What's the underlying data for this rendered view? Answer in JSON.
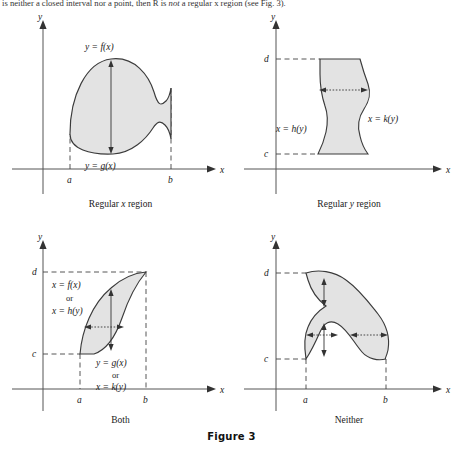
{
  "page": {
    "intro_text_before": "is neither a closed interval nor a point, then R is ",
    "intro_text_italic": "not",
    "intro_text_after": " a regular x region (see Fig. 3).",
    "figure_label": "Figure 3",
    "fill_color": "#e3e3e3",
    "stroke_color": "#3b3b3b",
    "axis_color": "#555555"
  },
  "panels": [
    {
      "id": "regular-x-region",
      "caption_prefix": "Regular ",
      "caption_italic": "x",
      "caption_suffix": " region",
      "axis_x_label": "x",
      "axis_y_label": "y",
      "tick_labels": [
        "a",
        "b"
      ],
      "curve_labels": [
        {
          "name": "upper-curve-label",
          "text": "y = f(x)"
        },
        {
          "name": "lower-curve-label",
          "text": "y = g(x)"
        }
      ],
      "arrow_direction": "vertical"
    },
    {
      "id": "regular-y-region",
      "caption_prefix": "Regular ",
      "caption_italic": "y",
      "caption_suffix": " region",
      "axis_x_label": "x",
      "axis_y_label": "y",
      "tick_labels": [
        "c",
        "d"
      ],
      "curve_labels": [
        {
          "name": "left-curve-label",
          "text": "x = h(y)"
        },
        {
          "name": "right-curve-label",
          "text": "x = k(y)"
        }
      ],
      "arrow_direction": "horizontal"
    },
    {
      "id": "both-region",
      "caption_prefix": "",
      "caption_italic": "",
      "caption_suffix": "Both",
      "axis_x_label": "x",
      "axis_y_label": "y",
      "tick_labels": [
        "a",
        "b",
        "c",
        "d"
      ],
      "curve_labels": [
        {
          "name": "upper-left-curve-label-1",
          "text": "x = f(x)"
        },
        {
          "name": "upper-left-curve-or",
          "text": "or"
        },
        {
          "name": "upper-left-curve-label-2",
          "text": "x = h(y)"
        },
        {
          "name": "lower-right-curve-label-1",
          "text": "y = g(x)"
        },
        {
          "name": "lower-right-curve-or",
          "text": "or"
        },
        {
          "name": "lower-right-curve-label-2",
          "text": "x = k(y)"
        }
      ],
      "arrow_direction": "both"
    },
    {
      "id": "neither-region",
      "caption_prefix": "",
      "caption_italic": "",
      "caption_suffix": "Neither",
      "axis_x_label": "x",
      "axis_y_label": "y",
      "tick_labels": [
        "a",
        "b",
        "c",
        "d"
      ],
      "curve_labels": [],
      "arrow_direction": "both"
    }
  ]
}
